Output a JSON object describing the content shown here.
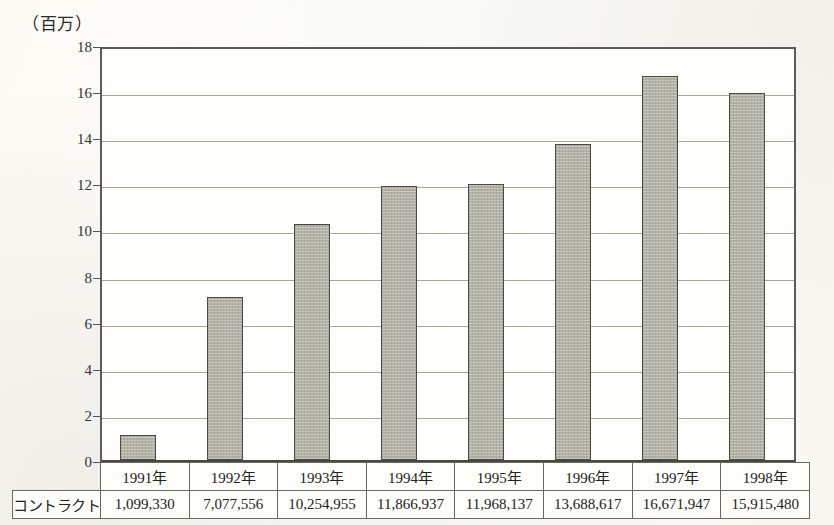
{
  "unit_label": "（百万）",
  "chart_data": {
    "type": "bar",
    "title": "",
    "subtitle": "",
    "xlabel": "",
    "ylabel": "",
    "unit_note": "（百万）",
    "categories": [
      "1991年",
      "1992年",
      "1993年",
      "1994年",
      "1995年",
      "1996年",
      "1997年",
      "1998年"
    ],
    "series": [
      {
        "name": "コントラクト",
        "values": [
          1.09933,
          7.077556,
          10.254955,
          11.866937,
          11.968137,
          13.688617,
          16.671947,
          15.91548
        ],
        "raw_values": [
          1099330,
          7077556,
          10254955,
          11866937,
          11968137,
          13688617,
          16671947,
          15915480
        ],
        "value_labels": [
          "1,099,330",
          "7,077,556",
          "10,254,955",
          "11,866,937",
          "11,968,137",
          "13,688,617",
          "16,671,947",
          "15,915,480"
        ]
      }
    ],
    "ylim": [
      0,
      18
    ],
    "yticks": [
      0,
      2,
      4,
      6,
      8,
      10,
      12,
      14,
      16,
      18
    ],
    "ytick_labels": [
      "0",
      "2",
      "4",
      "6",
      "8",
      "10",
      "12",
      "14",
      "16",
      "18"
    ],
    "grid": true,
    "legend": false,
    "bar_color": "#b3b2a6",
    "bar_border_color": "#4b4a42",
    "gridline_color": "#a8a795",
    "axis_color": "#5d5c52"
  },
  "table": {
    "row_header": "コントラクト",
    "headers": [
      "1991年",
      "1992年",
      "1993年",
      "1994年",
      "1995年",
      "1996年",
      "1997年",
      "1998年"
    ],
    "values": [
      "1,099,330",
      "7,077,556",
      "10,254,955",
      "11,866,937",
      "11,968,137",
      "13,688,617",
      "16,671,947",
      "15,915,480"
    ]
  }
}
